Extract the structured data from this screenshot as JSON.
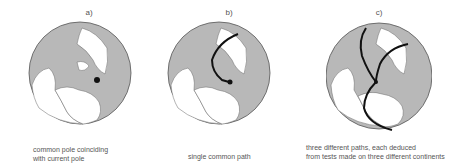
{
  "figure": {
    "panels": [
      {
        "label": "a)",
        "caption_lines": [
          "common pole coinciding",
          "with current pole"
        ]
      },
      {
        "label": "b)",
        "caption_lines": [
          "single common path"
        ]
      },
      {
        "label": "c)",
        "caption_lines": [
          "three different paths, each deduced",
          "from tests made on three different continents"
        ]
      }
    ]
  },
  "colors": {
    "land": "#b8b8b8",
    "ocean": "#ffffff",
    "outline": "#555555",
    "path": "#111111"
  }
}
